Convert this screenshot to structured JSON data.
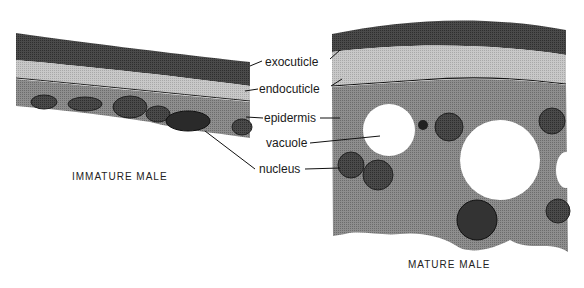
{
  "diagram": {
    "labels": {
      "exocuticle": "exocuticle",
      "endocuticle": "endocuticle",
      "epidermis": "epidermis",
      "vacuole": "vacuole",
      "nucleus": "nucleus"
    },
    "captions": {
      "immature": "IMMATURE MALE",
      "mature": "MATURE MALE"
    }
  }
}
